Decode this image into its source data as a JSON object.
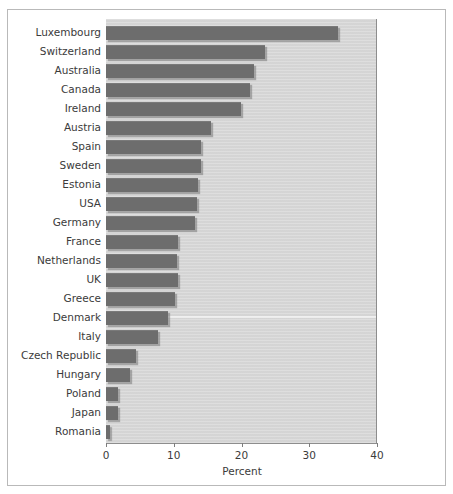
{
  "chart_data": {
    "type": "bar",
    "orientation": "horizontal",
    "title": "",
    "xlabel": "Percent",
    "ylabel": "",
    "xlim": [
      0,
      40
    ],
    "xticks": [
      0,
      10,
      20,
      30,
      40
    ],
    "xticklabels": [
      "0",
      "10",
      "20",
      "30",
      "40"
    ],
    "grid": false,
    "legend": null,
    "categories": [
      "Luxembourg",
      "Switzerland",
      "Australia",
      "Canada",
      "Ireland",
      "Austria",
      "Spain",
      "Sweden",
      "Estonia",
      "USA",
      "Germany",
      "France",
      "Netherlands",
      "UK",
      "Greece",
      "Denmark",
      "Italy",
      "Czech Republic",
      "Hungary",
      "Poland",
      "Japan",
      "Romania"
    ],
    "values": [
      34.2,
      23.4,
      21.8,
      21.2,
      19.9,
      15.5,
      14.0,
      14.0,
      13.6,
      13.4,
      13.1,
      10.6,
      10.5,
      10.7,
      10.2,
      9.1,
      7.7,
      4.4,
      3.6,
      1.8,
      1.7,
      0.6
    ]
  },
  "style": {
    "bar_color": "#6d6d6d",
    "panel_color": "#d7d7d7",
    "figure_background": "#ffffff",
    "border_color": "#b9b9b9",
    "text_color": "#3b3b3b",
    "axis_color": "#8d8d8d"
  }
}
